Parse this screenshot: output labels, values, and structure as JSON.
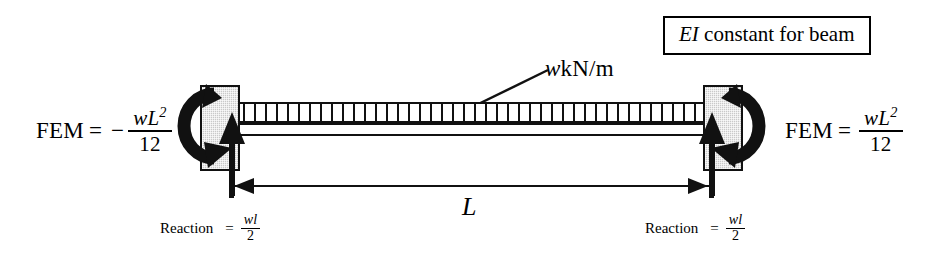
{
  "figure": {
    "note_box": {
      "symbol": "EI",
      "text": " constant for beam"
    },
    "load": {
      "symbol": "w",
      "units": " kN/m"
    },
    "span": {
      "label": "L"
    },
    "left_end": {
      "fem_label": "FEM",
      "equals": "=",
      "sign": "−",
      "numerator_var": "wL",
      "numerator_exp": "2",
      "denominator": "12"
    },
    "right_end": {
      "fem_label": "FEM",
      "equals": "=",
      "sign": "",
      "numerator_var": "wL",
      "numerator_exp": "2",
      "denominator": "12"
    },
    "left_reaction": {
      "label": "Reaction",
      "equals": "=",
      "numerator": "wl",
      "denominator": "2"
    },
    "right_reaction": {
      "label": "Reaction",
      "equals": "=",
      "numerator": "wl",
      "denominator": "2"
    },
    "colors": {
      "ink": "#111111",
      "support_fill": "#c9c9c9",
      "background": "#ffffff"
    }
  }
}
